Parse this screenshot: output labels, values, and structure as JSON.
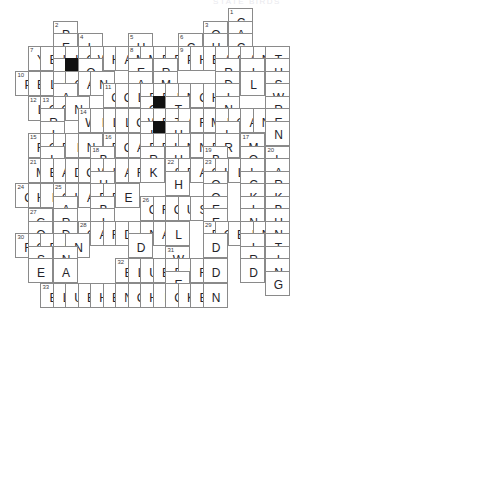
{
  "puzzle": {
    "title": "STATE BIRDS",
    "cell_size": 25,
    "origin_x": 15,
    "origin_y": 8,
    "grid_cols": 19,
    "grid_rows": 19,
    "colors": {
      "cell_border": "#8a8a8a",
      "block_fill": "#111111",
      "letter": "#24242a",
      "number": "#3a3a42",
      "background": "#ffffff",
      "title": "#e9e9ee"
    }
  },
  "cells": [
    {
      "c": 17,
      "r": 0,
      "letter": "C",
      "num": "1"
    },
    {
      "c": 3,
      "r": 1,
      "letter": "P",
      "num": "2"
    },
    {
      "c": 15,
      "r": 1,
      "letter": "Q",
      "num": "3"
    },
    {
      "c": 17,
      "r": 1,
      "letter": "A"
    },
    {
      "c": 3,
      "r": 2,
      "letter": "E"
    },
    {
      "c": 5,
      "r": 2,
      "letter": "L",
      "num": "4"
    },
    {
      "c": 9,
      "r": 2,
      "letter": "H",
      "num": "5"
    },
    {
      "c": 13,
      "r": 2,
      "letter": "C",
      "num": "6"
    },
    {
      "c": 15,
      "r": 2,
      "letter": "U"
    },
    {
      "c": 17,
      "r": 2,
      "letter": "C"
    },
    {
      "c": 1,
      "r": 3,
      "letter": "Y",
      "num": "7"
    },
    {
      "c": 2,
      "r": 3,
      "letter": "E"
    },
    {
      "c": 3,
      "r": 3,
      "letter": "L"
    },
    {
      "c": 4,
      "r": 3,
      "letter": "L"
    },
    {
      "c": 5,
      "r": 3,
      "letter": "O"
    },
    {
      "c": 6,
      "r": 3,
      "letter": "W"
    },
    {
      "c": 7,
      "r": 3,
      "letter": "H"
    },
    {
      "c": 8,
      "r": 3,
      "letter": "A"
    },
    {
      "c": 9,
      "r": 3,
      "letter": "M",
      "num": "8"
    },
    {
      "c": 10,
      "r": 3,
      "letter": "M"
    },
    {
      "c": 11,
      "r": 3,
      "letter": "E"
    },
    {
      "c": 12,
      "r": 3,
      "letter": "R"
    },
    {
      "c": 13,
      "r": 3,
      "letter": "P",
      "num": "9"
    },
    {
      "c": 14,
      "r": 3,
      "letter": "H"
    },
    {
      "c": 15,
      "r": 3,
      "letter": "E"
    },
    {
      "c": 16,
      "r": 3,
      "letter": "A"
    },
    {
      "c": 17,
      "r": 3,
      "letter": "S"
    },
    {
      "c": 18,
      "r": 3,
      "letter": "A"
    },
    {
      "c": 19,
      "r": 3,
      "letter": "N"
    },
    {
      "c": 20,
      "r": 3,
      "letter": "T"
    },
    {
      "c": 3,
      "r": 4,
      "letter": "I"
    },
    {
      "c": 4,
      "r": 4,
      "letter": "",
      "block": true
    },
    {
      "c": 5,
      "r": 4,
      "letter": "O"
    },
    {
      "c": 9,
      "r": 4,
      "letter": "E"
    },
    {
      "c": 11,
      "r": 4,
      "letter": "R"
    },
    {
      "c": 16,
      "r": 4,
      "letter": "R"
    },
    {
      "c": 18,
      "r": 4,
      "letter": "I"
    },
    {
      "c": 20,
      "r": 4,
      "letter": "U"
    },
    {
      "c": 0,
      "r": 5,
      "letter": "P",
      "num": "10"
    },
    {
      "c": 1,
      "r": 5,
      "letter": "E"
    },
    {
      "c": 2,
      "r": 5,
      "letter": "L"
    },
    {
      "c": 3,
      "r": 5,
      "letter": "I"
    },
    {
      "c": 4,
      "r": 5,
      "letter": "C"
    },
    {
      "c": 5,
      "r": 5,
      "letter": "A"
    },
    {
      "c": 6,
      "r": 5,
      "letter": "N"
    },
    {
      "c": 9,
      "r": 5,
      "letter": "A"
    },
    {
      "c": 11,
      "r": 5,
      "letter": "M"
    },
    {
      "c": 16,
      "r": 5,
      "letter": "D"
    },
    {
      "c": 18,
      "r": 5,
      "letter": "L"
    },
    {
      "c": 20,
      "r": 5,
      "letter": "S"
    },
    {
      "c": 3,
      "r": 6,
      "letter": "A"
    },
    {
      "c": 7,
      "r": 6,
      "letter": "G",
      "num": "11"
    },
    {
      "c": 8,
      "r": 6,
      "letter": "O"
    },
    {
      "c": 9,
      "r": 6,
      "letter": "L"
    },
    {
      "c": 10,
      "r": 6,
      "letter": "D"
    },
    {
      "c": 11,
      "r": 6,
      "letter": "F"
    },
    {
      "c": 12,
      "r": 6,
      "letter": "I"
    },
    {
      "c": 13,
      "r": 6,
      "letter": "N"
    },
    {
      "c": 14,
      "r": 6,
      "letter": "C"
    },
    {
      "c": 15,
      "r": 6,
      "letter": "H"
    },
    {
      "c": 16,
      "r": 6,
      "letter": "I"
    },
    {
      "c": 20,
      "r": 6,
      "letter": "W"
    },
    {
      "c": 1,
      "r": 7,
      "letter": "L",
      "num": "12"
    },
    {
      "c": 2,
      "r": 7,
      "letter": "O",
      "num": "13"
    },
    {
      "c": 3,
      "r": 7,
      "letter": "O"
    },
    {
      "c": 4,
      "r": 7,
      "letter": "N"
    },
    {
      "c": 10,
      "r": 7,
      "letter": "O"
    },
    {
      "c": 11,
      "r": 7,
      "letter": "",
      "block": true
    },
    {
      "c": 12,
      "r": 7,
      "letter": "T"
    },
    {
      "c": 16,
      "r": 7,
      "letter": "N"
    },
    {
      "c": 20,
      "r": 7,
      "letter": "R"
    },
    {
      "c": 2,
      "r": 8,
      "letter": "R"
    },
    {
      "c": 5,
      "r": 8,
      "letter": "W",
      "num": "14"
    },
    {
      "c": 6,
      "r": 8,
      "letter": "I"
    },
    {
      "c": 7,
      "r": 8,
      "letter": "L"
    },
    {
      "c": 8,
      "r": 8,
      "letter": "L"
    },
    {
      "c": 9,
      "r": 8,
      "letter": "O"
    },
    {
      "c": 10,
      "r": 8,
      "letter": "W"
    },
    {
      "c": 11,
      "r": 8,
      "letter": "P"
    },
    {
      "c": 12,
      "r": 8,
      "letter": "T"
    },
    {
      "c": 13,
      "r": 8,
      "letter": "A"
    },
    {
      "c": 14,
      "r": 8,
      "letter": "R"
    },
    {
      "c": 15,
      "r": 8,
      "letter": "M"
    },
    {
      "c": 16,
      "r": 8,
      "letter": "I"
    },
    {
      "c": 17,
      "r": 8,
      "letter": "G"
    },
    {
      "c": 18,
      "r": 8,
      "letter": "A"
    },
    {
      "c": 19,
      "r": 8,
      "letter": "N"
    },
    {
      "c": 20,
      "r": 8,
      "letter": "E"
    },
    {
      "c": 2,
      "r": 9,
      "letter": "I"
    },
    {
      "c": 10,
      "r": 9,
      "letter": "L"
    },
    {
      "c": 11,
      "r": 9,
      "letter": "",
      "block": true
    },
    {
      "c": 12,
      "r": 9,
      "letter": "H"
    },
    {
      "c": 16,
      "r": 9,
      "letter": "L"
    },
    {
      "c": 20,
      "r": 9,
      "letter": "N"
    },
    {
      "c": 1,
      "r": 10,
      "letter": "R",
      "num": "15"
    },
    {
      "c": 2,
      "r": 10,
      "letter": "O"
    },
    {
      "c": 3,
      "r": 10,
      "letter": "B"
    },
    {
      "c": 4,
      "r": 10,
      "letter": "I"
    },
    {
      "c": 5,
      "r": 10,
      "letter": "N"
    },
    {
      "c": 7,
      "r": 10,
      "letter": "R",
      "num": "16"
    },
    {
      "c": 8,
      "r": 10,
      "letter": "O"
    },
    {
      "c": 9,
      "r": 10,
      "letter": "A"
    },
    {
      "c": 10,
      "r": 10,
      "letter": "D"
    },
    {
      "c": 11,
      "r": 10,
      "letter": "R"
    },
    {
      "c": 12,
      "r": 10,
      "letter": "U"
    },
    {
      "c": 13,
      "r": 10,
      "letter": "N"
    },
    {
      "c": 14,
      "r": 10,
      "letter": "N"
    },
    {
      "c": 15,
      "r": 10,
      "letter": "E"
    },
    {
      "c": 16,
      "r": 10,
      "letter": "R"
    },
    {
      "c": 18,
      "r": 10,
      "letter": "M",
      "num": "17"
    },
    {
      "c": 2,
      "r": 11,
      "letter": "L"
    },
    {
      "c": 6,
      "r": 11,
      "letter": "B",
      "num": "18"
    },
    {
      "c": 10,
      "r": 11,
      "letter": "R"
    },
    {
      "c": 12,
      "r": 11,
      "letter": "U"
    },
    {
      "c": 15,
      "r": 11,
      "letter": "B",
      "num": "19"
    },
    {
      "c": 18,
      "r": 11,
      "letter": "O"
    },
    {
      "c": 20,
      "r": 11,
      "letter": "L",
      "num": "20"
    },
    {
      "c": 1,
      "r": 12,
      "letter": "M",
      "num": "21"
    },
    {
      "c": 2,
      "r": 12,
      "letter": "E"
    },
    {
      "c": 3,
      "r": 12,
      "letter": "A"
    },
    {
      "c": 4,
      "r": 12,
      "letter": "D"
    },
    {
      "c": 5,
      "r": 12,
      "letter": "O"
    },
    {
      "c": 6,
      "r": 12,
      "letter": "W"
    },
    {
      "c": 7,
      "r": 12,
      "letter": "L"
    },
    {
      "c": 8,
      "r": 12,
      "letter": "A"
    },
    {
      "c": 9,
      "r": 12,
      "letter": "R"
    },
    {
      "c": 10,
      "r": 12,
      "letter": "K"
    },
    {
      "c": 12,
      "r": 12,
      "letter": "S",
      "num": "22"
    },
    {
      "c": 13,
      "r": 12,
      "letter": "E"
    },
    {
      "c": 14,
      "r": 12,
      "letter": "A"
    },
    {
      "c": 15,
      "r": 12,
      "letter": "G",
      "num": "23"
    },
    {
      "c": 16,
      "r": 12,
      "letter": "U"
    },
    {
      "c": 17,
      "r": 12,
      "letter": "L"
    },
    {
      "c": 18,
      "r": 12,
      "letter": "L"
    },
    {
      "c": 20,
      "r": 12,
      "letter": "A"
    },
    {
      "c": 6,
      "r": 13,
      "letter": "U"
    },
    {
      "c": 12,
      "r": 13,
      "letter": "H"
    },
    {
      "c": 15,
      "r": 13,
      "letter": "O"
    },
    {
      "c": 18,
      "r": 13,
      "letter": "C"
    },
    {
      "c": 20,
      "r": 13,
      "letter": "R"
    },
    {
      "c": 0,
      "r": 14,
      "letter": "C",
      "num": "24"
    },
    {
      "c": 1,
      "r": 14,
      "letter": "H"
    },
    {
      "c": 2,
      "r": 14,
      "letter": "I"
    },
    {
      "c": 3,
      "r": 14,
      "letter": "C",
      "num": "25"
    },
    {
      "c": 4,
      "r": 14,
      "letter": "K"
    },
    {
      "c": 5,
      "r": 14,
      "letter": "A"
    },
    {
      "c": 6,
      "r": 14,
      "letter": "D"
    },
    {
      "c": 7,
      "r": 14,
      "letter": "E"
    },
    {
      "c": 8,
      "r": 14,
      "letter": "E"
    },
    {
      "c": 15,
      "r": 14,
      "letter": "O"
    },
    {
      "c": 18,
      "r": 14,
      "letter": "K"
    },
    {
      "c": 20,
      "r": 14,
      "letter": "K"
    },
    {
      "c": 3,
      "r": 15,
      "letter": "A"
    },
    {
      "c": 6,
      "r": 15,
      "letter": "B"
    },
    {
      "c": 10,
      "r": 15,
      "letter": "G",
      "num": "26"
    },
    {
      "c": 11,
      "r": 15,
      "letter": "R"
    },
    {
      "c": 12,
      "r": 15,
      "letter": "O"
    },
    {
      "c": 13,
      "r": 15,
      "letter": "U"
    },
    {
      "c": 14,
      "r": 15,
      "letter": "S"
    },
    {
      "c": 15,
      "r": 15,
      "letter": "E"
    },
    {
      "c": 18,
      "r": 15,
      "letter": "I"
    },
    {
      "c": 20,
      "r": 15,
      "letter": "B"
    },
    {
      "c": 1,
      "r": 16,
      "letter": "G",
      "num": "27"
    },
    {
      "c": 3,
      "r": 16,
      "letter": "R"
    },
    {
      "c": 6,
      "r": 16,
      "letter": "I"
    },
    {
      "c": 15,
      "r": 16,
      "letter": "E"
    },
    {
      "c": 18,
      "r": 16,
      "letter": "N"
    },
    {
      "c": 20,
      "r": 16,
      "letter": "U"
    },
    {
      "c": 1,
      "r": 17,
      "letter": "O"
    },
    {
      "c": 3,
      "r": 17,
      "letter": "D"
    },
    {
      "c": 5,
      "r": 17,
      "letter": "C",
      "num": "28"
    },
    {
      "c": 6,
      "r": 17,
      "letter": "A"
    },
    {
      "c": 7,
      "r": 17,
      "letter": "R"
    },
    {
      "c": 8,
      "r": 17,
      "letter": "D"
    },
    {
      "c": 9,
      "r": 17,
      "letter": "I"
    },
    {
      "c": 10,
      "r": 17,
      "letter": "N"
    },
    {
      "c": 11,
      "r": 17,
      "letter": "A"
    },
    {
      "c": 12,
      "r": 17,
      "letter": "L"
    },
    {
      "c": 15,
      "r": 17,
      "letter": "R",
      "num": "29"
    },
    {
      "c": 16,
      "r": 17,
      "letter": "O"
    },
    {
      "c": 17,
      "r": 17,
      "letter": "B"
    },
    {
      "c": 18,
      "r": 17,
      "letter": "I"
    },
    {
      "c": 19,
      "r": 17,
      "letter": "N"
    },
    {
      "c": 20,
      "r": 17,
      "letter": "N"
    },
    {
      "c": 0,
      "r": 18,
      "letter": "R",
      "num": "30"
    },
    {
      "c": 1,
      "r": 18,
      "letter": "O"
    },
    {
      "c": 2,
      "r": 18,
      "letter": "B"
    },
    {
      "c": 3,
      "r": 18,
      "letter": "I"
    },
    {
      "c": 4,
      "r": 18,
      "letter": "N"
    },
    {
      "c": 9,
      "r": 18,
      "letter": "D"
    },
    {
      "c": 15,
      "r": 18,
      "letter": "D"
    },
    {
      "c": 18,
      "r": 18,
      "letter": "I"
    },
    {
      "c": 20,
      "r": 18,
      "letter": "T"
    },
    {
      "c": 1,
      "r": 19,
      "letter": "S"
    },
    {
      "c": 3,
      "r": 19,
      "letter": "N"
    },
    {
      "c": 12,
      "r": 19,
      "letter": "W",
      "num": "31"
    },
    {
      "c": 18,
      "r": 19,
      "letter": "R"
    },
    {
      "c": 20,
      "r": 19,
      "letter": "I"
    },
    {
      "c": 1,
      "r": 20,
      "letter": "E"
    },
    {
      "c": 3,
      "r": 20,
      "letter": "A"
    },
    {
      "c": 8,
      "r": 20,
      "letter": "B",
      "num": "32"
    },
    {
      "c": 9,
      "r": 20,
      "letter": "L"
    },
    {
      "c": 10,
      "r": 20,
      "letter": "U"
    },
    {
      "c": 11,
      "r": 20,
      "letter": "E"
    },
    {
      "c": 12,
      "r": 20,
      "letter": "B"
    },
    {
      "c": 13,
      "r": 20,
      "letter": "I"
    },
    {
      "c": 14,
      "r": 20,
      "letter": "R"
    },
    {
      "c": 15,
      "r": 20,
      "letter": "D"
    },
    {
      "c": 18,
      "r": 20,
      "letter": "D"
    },
    {
      "c": 20,
      "r": 20,
      "letter": "N"
    },
    {
      "c": 12,
      "r": 21,
      "letter": "E"
    },
    {
      "c": 20,
      "r": 21,
      "letter": "G"
    },
    {
      "c": 2,
      "r": 22,
      "letter": "B",
      "num": "33"
    },
    {
      "c": 3,
      "r": 22,
      "letter": "L"
    },
    {
      "c": 4,
      "r": 22,
      "letter": "U"
    },
    {
      "c": 5,
      "r": 22,
      "letter": "E"
    },
    {
      "c": 6,
      "r": 22,
      "letter": "H"
    },
    {
      "c": 7,
      "r": 22,
      "letter": "E"
    },
    {
      "c": 8,
      "r": 22,
      "letter": "N"
    },
    {
      "c": 9,
      "r": 22,
      "letter": "C"
    },
    {
      "c": 10,
      "r": 22,
      "letter": "H"
    },
    {
      "c": 11,
      "r": 22,
      "letter": "I"
    },
    {
      "c": 12,
      "r": 22,
      "letter": "C"
    },
    {
      "c": 13,
      "r": 22,
      "letter": "K"
    },
    {
      "c": 14,
      "r": 22,
      "letter": "E"
    },
    {
      "c": 15,
      "r": 22,
      "letter": "N"
    }
  ],
  "answers": {
    "across": [
      {
        "num": "7",
        "word": "YELLOWHAMMER"
      },
      {
        "num": "9",
        "word": "PHEASANT"
      },
      {
        "num": "10",
        "word": "PELICAN"
      },
      {
        "num": "11",
        "word": "GOLDFINCH"
      },
      {
        "num": "12",
        "word": "LOON"
      },
      {
        "num": "14",
        "word": "WILLOWPTARMIGAN"
      },
      {
        "num": "15",
        "word": "ROBIN"
      },
      {
        "num": "16",
        "word": "ROADRUNNER"
      },
      {
        "num": "21",
        "word": "MEADOWLARK"
      },
      {
        "num": "22",
        "word": "SEAGULL"
      },
      {
        "num": "24",
        "word": "CHICKADEE"
      },
      {
        "num": "26",
        "word": "GROUSE"
      },
      {
        "num": "28",
        "word": "CARDINAL"
      },
      {
        "num": "29",
        "word": "ROBIN"
      },
      {
        "num": "30",
        "word": "ROBIN"
      },
      {
        "num": "32",
        "word": "BLUEBIRD"
      },
      {
        "num": "33",
        "word": "BLUEHENCHICKEN"
      }
    ],
    "down": [
      {
        "num": "1",
        "word": "CACTUSWREN"
      },
      {
        "num": "2",
        "word": "PELICAN"
      },
      {
        "num": "3",
        "word": "QUAIL"
      },
      {
        "num": "4",
        "word": "LOON"
      },
      {
        "num": "5",
        "word": "HERMITTHRUSH"
      },
      {
        "num": "6",
        "word": "CARDINAL"
      },
      {
        "num": "8",
        "word": "MEADOWLARK"
      },
      {
        "num": "13",
        "word": "ORIOLE"
      },
      {
        "num": "17",
        "word": "MOCKINGBIRD"
      },
      {
        "num": "18",
        "word": "BLUEBIRD"
      },
      {
        "num": "19",
        "word": "BOBWHITE"
      },
      {
        "num": "20",
        "word": "LARKBUNTING"
      },
      {
        "num": "23",
        "word": "GOOSE"
      },
      {
        "num": "25",
        "word": "CARDINAL"
      },
      {
        "num": "27",
        "word": "GOOSE"
      },
      {
        "num": "31",
        "word": "WREN"
      }
    ]
  }
}
